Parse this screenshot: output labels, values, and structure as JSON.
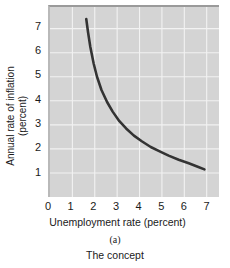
{
  "chart_data": {
    "type": "line",
    "title": "",
    "xlabel": "Unemployment rate (percent)",
    "ylabel_line1": "Annual rate of inflation",
    "ylabel_line2": "(percent)",
    "panel_label": "(a)",
    "caption": "The concept",
    "xlim": [
      0,
      7.55
    ],
    "ylim": [
      0,
      7.9
    ],
    "xticks": [
      "0",
      "1",
      "2",
      "3",
      "4",
      "5",
      "6",
      "7"
    ],
    "xtick_values": [
      0,
      1,
      2,
      3,
      4,
      5,
      6,
      7
    ],
    "yticks": [
      "1",
      "2",
      "3",
      "4",
      "5",
      "6",
      "7"
    ],
    "ytick_values": [
      1,
      2,
      3,
      4,
      5,
      6,
      7
    ],
    "grid": true,
    "grid_color": "#f2f2f2",
    "plot_background": "#d4d4d4",
    "legend": null,
    "series": [
      {
        "name": "Phillips curve",
        "color": "#333333",
        "line_width": 2.6,
        "x": [
          1.62,
          1.7,
          1.8,
          1.95,
          2.1,
          2.3,
          2.55,
          2.8,
          3.1,
          3.4,
          3.75,
          4.1,
          4.5,
          4.9,
          5.3,
          5.75,
          6.2,
          6.6,
          6.9
        ],
        "y": [
          7.4,
          6.85,
          6.25,
          5.55,
          5.0,
          4.45,
          3.95,
          3.55,
          3.15,
          2.85,
          2.55,
          2.32,
          2.08,
          1.9,
          1.72,
          1.55,
          1.4,
          1.26,
          1.15
        ]
      }
    ]
  }
}
